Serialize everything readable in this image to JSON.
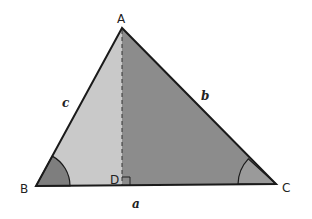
{
  "diagram": {
    "type": "triangle-with-altitude",
    "vertices": {
      "A": {
        "label": "A",
        "x": 122,
        "y": 28
      },
      "B": {
        "label": "B",
        "x": 36,
        "y": 186
      },
      "C": {
        "label": "C",
        "x": 276,
        "y": 184
      },
      "D": {
        "label": "D",
        "x": 122,
        "y": 185
      }
    },
    "sides": {
      "a": {
        "label": "a"
      },
      "b": {
        "label": "b"
      },
      "c": {
        "label": "c"
      }
    },
    "altitude": {
      "from": "A",
      "to": "D",
      "style": "dashed",
      "right_angle_marker": true
    },
    "angle_marks": [
      "B",
      "C"
    ],
    "colors": {
      "light_region": "#c9c9c9",
      "dark_region": "#8c8c8c",
      "angle_wedge_B": "#7e7e7e",
      "angle_wedge_C": "#9a9a9a",
      "stroke": "#1a1a1a"
    }
  }
}
